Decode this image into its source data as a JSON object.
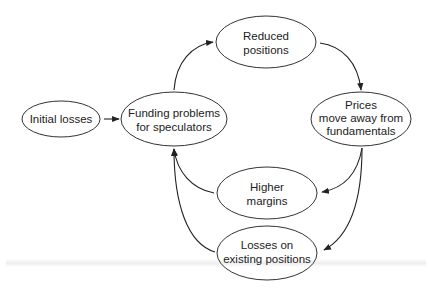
{
  "diagram": {
    "type": "feedback-loop",
    "stroke_color": "#333333",
    "nodes": [
      {
        "id": "initial_losses",
        "lines": [
          "Initial losses"
        ],
        "cx": 61,
        "cy": 119,
        "rx": 39,
        "ry": 18
      },
      {
        "id": "funding_problems",
        "lines": [
          "Funding problems",
          "for speculators"
        ],
        "cx": 174,
        "cy": 119,
        "rx": 53,
        "ry": 27
      },
      {
        "id": "reduced_positions",
        "lines": [
          "Reduced",
          "positions"
        ],
        "cx": 266,
        "cy": 42,
        "rx": 50,
        "ry": 26
      },
      {
        "id": "prices_move",
        "lines": [
          "Prices",
          "move away from",
          "fundamentals"
        ],
        "cx": 361,
        "cy": 119,
        "rx": 50,
        "ry": 27
      },
      {
        "id": "higher_margins",
        "lines": [
          "Higher",
          "margins"
        ],
        "cx": 267,
        "cy": 193,
        "rx": 50,
        "ry": 26
      },
      {
        "id": "losses_existing",
        "lines": [
          "Losses on",
          "existing positions"
        ],
        "cx": 267,
        "cy": 253,
        "rx": 50,
        "ry": 27
      }
    ],
    "edges": [
      {
        "from": "initial_losses",
        "to": "funding_problems"
      },
      {
        "from": "funding_problems",
        "to": "reduced_positions"
      },
      {
        "from": "reduced_positions",
        "to": "prices_move"
      },
      {
        "from": "prices_move",
        "to": "higher_margins"
      },
      {
        "from": "prices_move",
        "to": "losses_existing"
      },
      {
        "from": "higher_margins",
        "to": "funding_problems"
      },
      {
        "from": "losses_existing",
        "to": "funding_problems"
      }
    ]
  },
  "labels": {
    "initial_losses": "Initial losses",
    "funding_l1": "Funding problems",
    "funding_l2": "for speculators",
    "reduced_l1": "Reduced",
    "reduced_l2": "positions",
    "prices_l1": "Prices",
    "prices_l2": "move away from",
    "prices_l3": "fundamentals",
    "margins_l1": "Higher",
    "margins_l2": "margins",
    "losses_l1": "Losses on",
    "losses_l2": "existing positions"
  }
}
